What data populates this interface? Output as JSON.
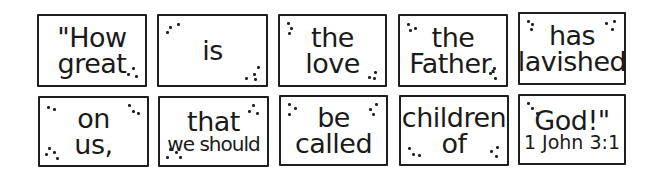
{
  "verse": {
    "reference": "1 John 3:1",
    "cards": [
      {
        "lines": [
          "\"How",
          "great"
        ],
        "dots": [
          "br"
        ]
      },
      {
        "lines": [
          "is"
        ],
        "dots": [
          "tl",
          "br"
        ]
      },
      {
        "lines": [
          "the",
          "love"
        ],
        "dots": [
          "tl",
          "br"
        ]
      },
      {
        "lines": [
          "the",
          "Father."
        ],
        "dots": [
          "tl",
          "br"
        ]
      },
      {
        "lines": [
          "has",
          "lavished"
        ],
        "dots": [
          "tl",
          "tr"
        ]
      },
      {
        "lines": [
          "on",
          "us,"
        ],
        "dots": [
          "tl",
          "tr",
          "bl"
        ]
      },
      {
        "lines": [
          "that",
          "we should"
        ],
        "dots": [
          "tr",
          "bl"
        ]
      },
      {
        "lines": [
          "be",
          "called"
        ],
        "dots": [
          "tl",
          "tr"
        ]
      },
      {
        "lines": [
          "children",
          "of"
        ],
        "dots": [
          "bl",
          "br"
        ]
      },
      {
        "lines": [
          "God!\"",
          "1 John 3:1"
        ],
        "dots": [
          "tl"
        ]
      }
    ]
  },
  "colors": {
    "ink": "#1e1e1e",
    "background": "#ffffff"
  }
}
